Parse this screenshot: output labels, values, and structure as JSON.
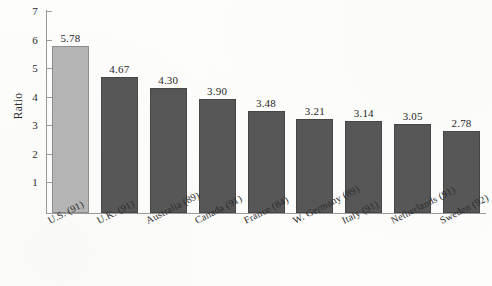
{
  "chart_data": {
    "type": "bar",
    "title": "",
    "xlabel": "",
    "ylabel": "Ratio",
    "ylim": [
      0,
      7
    ],
    "grid": false,
    "legend": "none",
    "y_ticks": [
      "7",
      "6",
      "5",
      "4",
      "3",
      "2",
      "1"
    ],
    "categories": [
      "U.S. (91)",
      "U.K. (91)",
      "Australia (89)",
      "Canada (91)",
      "France (84)",
      "W. Germany (89)",
      "Italy (91)",
      "Netherlands (91)",
      "Sweden (92)"
    ],
    "values": [
      5.78,
      4.67,
      4.3,
      3.9,
      3.48,
      3.21,
      3.14,
      3.05,
      2.78
    ],
    "value_labels": [
      "5.78",
      "4.67",
      "4.30",
      "3.90",
      "3.48",
      "3.21",
      "3.14",
      "3.05",
      "2.78"
    ],
    "bar_colors": [
      "#b4b4b4",
      "#575757",
      "#575757",
      "#575757",
      "#575757",
      "#575757",
      "#575757",
      "#575757",
      "#575757"
    ],
    "highlight_index": 0
  },
  "colors": {
    "background": "#fdfdfc",
    "axis": "#9a9a9a",
    "text": "#2b2b2b",
    "bar_light": "#b4b4b4",
    "bar_dark": "#575757"
  }
}
